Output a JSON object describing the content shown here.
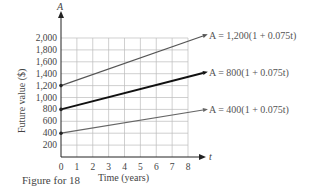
{
  "chart_data": {
    "type": "line",
    "title": "",
    "xlabel": "Time (years)",
    "ylabel": "Future value ($)",
    "x_axis_var": "t",
    "y_axis_var": "A",
    "xlim": [
      0,
      8
    ],
    "ylim": [
      0,
      2000
    ],
    "x_ticks": [
      "0",
      "1",
      "2",
      "3",
      "4",
      "5",
      "6",
      "7",
      "8"
    ],
    "y_ticks": [
      "200",
      "400",
      "600",
      "800",
      "1,000",
      "1,200",
      "1,400",
      "1,600",
      "1,800",
      "2,000"
    ],
    "grid": true,
    "series": [
      {
        "name": "A = 1,200(1 + 0.075t)",
        "x": [
          0,
          8
        ],
        "y": [
          1200,
          1920
        ],
        "color": "#555555",
        "width": 1.2
      },
      {
        "name": "A = 800(1 + 0.075t)",
        "x": [
          0,
          8
        ],
        "y": [
          800,
          1280
        ],
        "color": "#111111",
        "width": 2
      },
      {
        "name": "A = 400(1 + 0.075t)",
        "x": [
          0,
          8
        ],
        "y": [
          400,
          640
        ],
        "color": "#666666",
        "width": 1.2
      }
    ]
  },
  "labels": {
    "y_var": "A",
    "x_var": "t",
    "ylabel": "Future value ($)",
    "xlabel": "Time (years)",
    "eq1": "A = 1,200(1 + 0.075t)",
    "eq2": "A = 800(1 + 0.075t)",
    "eq3": "A = 400(1 + 0.075t)",
    "caption": "Figure for 18"
  }
}
